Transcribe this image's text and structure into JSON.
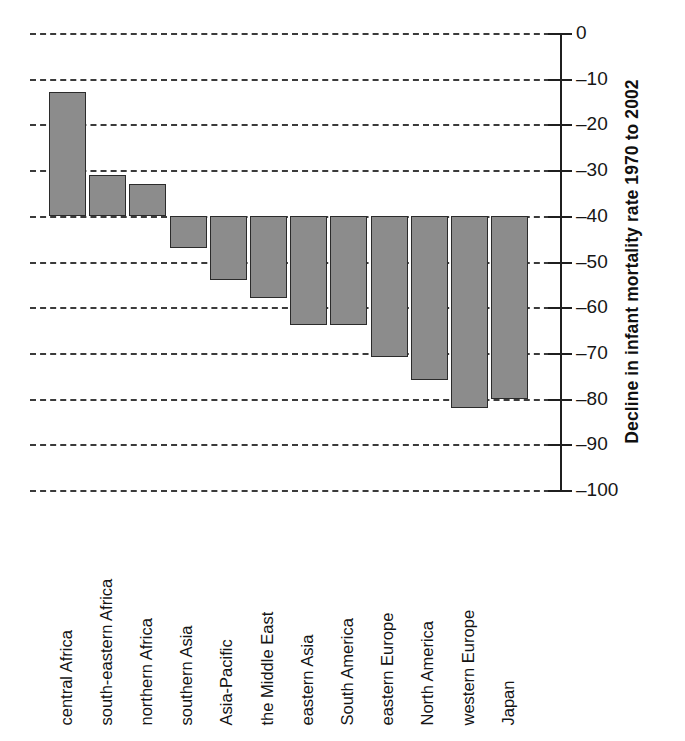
{
  "chart_data": {
    "type": "bar",
    "title": "",
    "xlabel": "",
    "ylabel": "Decline in infant mortality rate 1970 to 2002",
    "ylim": [
      -100,
      0
    ],
    "baseline": -40,
    "grid": true,
    "gridlines": [
      0,
      -10,
      -20,
      -30,
      -40,
      -50,
      -60,
      -70,
      -80,
      -90,
      -100
    ],
    "ytick_labels": [
      "0",
      "–10",
      "–20",
      "–30",
      "–40",
      "–50",
      "–60",
      "–70",
      "–80",
      "–90",
      "–100"
    ],
    "yticks": [
      0,
      -10,
      -20,
      -30,
      -40,
      -50,
      -60,
      -70,
      -80,
      -90,
      -100
    ],
    "axis_position": "right",
    "legend": "none",
    "bar_color": "#8c8c8c",
    "bar_edge_color": "#2b2b2b",
    "categories": [
      "central Africa",
      "south-eastern Africa",
      "northern Africa",
      "southern Asia",
      "Asia-Pacific",
      "the Middle East",
      "eastern Asia",
      "South America",
      "eastern Europe",
      "North America",
      "western Europe",
      "Japan"
    ],
    "values": [
      -13,
      -31,
      -33,
      -47,
      -54,
      -58,
      -64,
      -64,
      -71,
      -76,
      -82,
      -80
    ]
  }
}
